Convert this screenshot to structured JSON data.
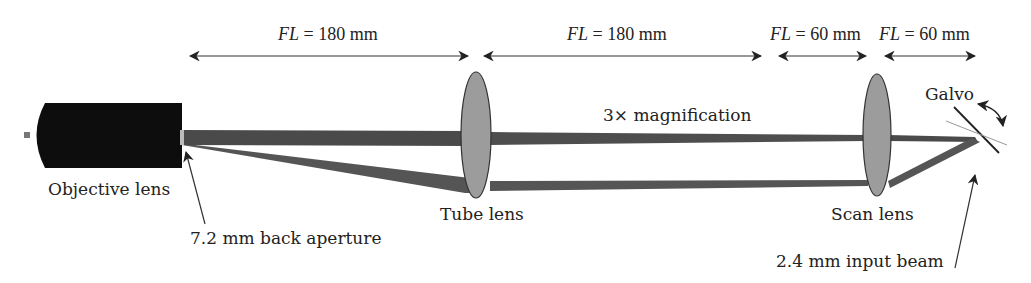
{
  "dimensions": [
    {
      "label_italic": "FL",
      "label_rest": " = 180 mm",
      "x1": 188,
      "x2": 470
    },
    {
      "label_italic": "FL",
      "label_rest": " = 180 mm",
      "x1": 482,
      "x2": 763
    },
    {
      "label_italic": "FL",
      "label_rest": " = 60 mm",
      "x1": 777,
      "x2": 868
    },
    {
      "label_italic": "FL",
      "label_rest": " = 60 mm",
      "x1": 883,
      "x2": 977
    }
  ],
  "labels": {
    "objective": "Objective lens",
    "tube_lens": "Tube lens",
    "scan_lens": "Scan lens",
    "galvo": "Galvo",
    "magnification": "3× magnification",
    "back_aperture": "7.2 mm back aperture",
    "input_beam": "2.4 mm input beam"
  },
  "colors": {
    "objective": "#0d0d0d",
    "beam": "#4a4a4a",
    "lens_fill": "#9c9c9c",
    "lens_stroke": "#333333",
    "text": "#222222"
  }
}
